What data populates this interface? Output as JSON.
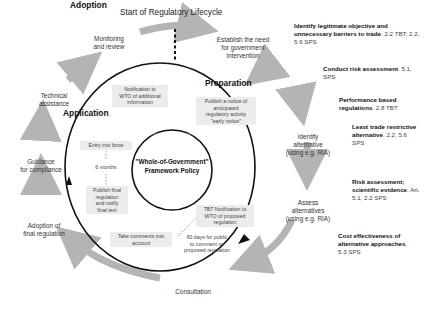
{
  "title": "Start of Regulatory Lifecycle",
  "center": {
    "line1": "\"Whole-of-Government\"",
    "line2": "Framework Policy"
  },
  "phases": {
    "preparation": "Preparation",
    "application": "Application",
    "adoption": "Adoption"
  },
  "outer_steps": {
    "establish": [
      "Establish the need",
      "for government",
      "intervention"
    ],
    "identify": [
      "Identify",
      "alternative",
      "(using e.g. RIA)"
    ],
    "assess": [
      "Assess",
      "alternatives",
      "(using e.g. RIA)"
    ],
    "consultation": "Consultation",
    "adoption_final": [
      "Adoption of",
      "final regulation"
    ],
    "guidance": [
      "Guidance",
      "for compliance"
    ],
    "technical": [
      "Technical",
      "assistance"
    ],
    "monitoring": [
      "Monitoring",
      "and review"
    ]
  },
  "inner_boxes": {
    "notification_additional": [
      "Notification to",
      "WTO of additional",
      "information"
    ],
    "early_notice": [
      "Publish a notice of",
      "anticipated",
      "regulatory activity",
      "\"early notice\""
    ],
    "entry_into_force": "Entry into force",
    "six_months": "6 months",
    "publish_final": [
      "Publish final",
      "regulation",
      "and notify",
      "final text"
    ],
    "tbt_notification": [
      "TBT Notification to",
      "WTO of proposed",
      "regulation"
    ],
    "take_comments": [
      "Take comments into",
      "account"
    ],
    "sixty_days": [
      "60 days for public",
      "to comment on",
      "proposed regulation"
    ]
  },
  "side_notes": [
    {
      "bold": "Identify legitimate objective and unnecessary barriers to trade",
      "ref": ". 2.2 TBT; 2.2, 5.6 SPS"
    },
    {
      "bold": "Conduct risk assessment",
      "ref": ". 5.1, SPS"
    },
    {
      "bold": "Performance based regulations",
      "ref": ". 2.8 TBT"
    },
    {
      "bold": "Least trade restrictive alternative",
      "ref": ". 2.2, 5.6 SPS"
    },
    {
      "bold": "Risk assessment; scientific evidence",
      "ref": ". Art. 5.1, 2.2 SPS"
    },
    {
      "bold": "Cost effectiveness of alternative approaches",
      "ref": ". 5.3 SPS"
    }
  ],
  "colors": {
    "arrow_gray": "#b4b4b4",
    "box_gray": "#ececec",
    "line": "#111111"
  }
}
